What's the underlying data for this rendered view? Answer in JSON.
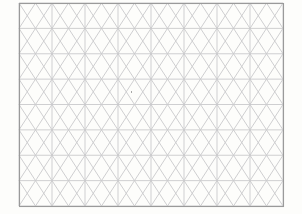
{
  "image": {
    "title": "Triangular Grid Paper",
    "description": "Blank isometric / triangular grid sheet",
    "width": 302,
    "height": 214,
    "background_color": "#fdfdfb",
    "paper_color": "#ffffff"
  },
  "frame": {
    "name": "grid-border-frame",
    "x": 19,
    "y": 3,
    "width": 264,
    "height": 203,
    "stroke_color": "#9a9a9a",
    "stroke_width": 1.1
  },
  "grid": {
    "type": "triangular",
    "line_color": "#c9c9cc",
    "line_width": 0.9,
    "columns": 8,
    "rows": 8,
    "cell_width": 33,
    "cell_height": 25.375,
    "origin_x": 19,
    "origin_y": 3,
    "vertical_lines": [
      19,
      52,
      85,
      118,
      151,
      184,
      217,
      250,
      283
    ],
    "horizontal_lines": [
      3,
      28.4,
      53.8,
      79.1,
      104.5,
      129.9,
      155.3,
      180.6,
      206
    ],
    "diagonals": "alternating up-slope and down-slope across each row forming triangles"
  },
  "artifacts": [
    {
      "name": "dust-speck",
      "x": 131,
      "y": 91,
      "color": "#8b8b8b"
    }
  ],
  "labels": {
    "none": ""
  }
}
